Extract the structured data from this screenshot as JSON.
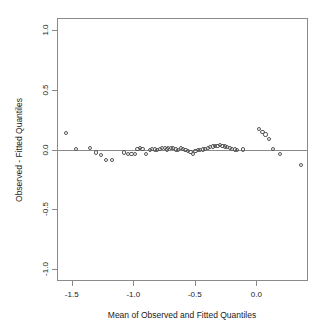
{
  "chart_data": {
    "type": "scatter",
    "title": "",
    "xlabel": "Mean of Observed and Fitted Quantiles",
    "ylabel": "Observed - Fitted Quantiles",
    "xlim": [
      -1.62,
      0.42
    ],
    "ylim": [
      -1.1,
      1.1
    ],
    "xticks": [
      -1.5,
      -1.0,
      -0.5,
      0.0
    ],
    "xtick_labels": [
      "-1.5",
      "-1.0",
      "-0.5",
      "0.0"
    ],
    "yticks": [
      1.0,
      0.5,
      0.0,
      -0.5,
      -1.0
    ],
    "ytick_labels": [
      "1.0",
      "0.5",
      "0.0",
      "-0.5",
      "-1.0"
    ],
    "grid": false,
    "legend": null,
    "marker": "open-circle",
    "marker_color": "#555555",
    "reference_line": {
      "orientation": "horizontal",
      "y": 0.0,
      "color": "#8a8a8a"
    },
    "series": [
      {
        "name": "residual-quantiles",
        "x": [
          -1.545,
          -1.465,
          -1.355,
          -1.305,
          -1.265,
          -1.225,
          -1.175,
          -1.075,
          -1.045,
          -1.015,
          -0.985,
          -0.965,
          -0.945,
          -0.925,
          -0.895,
          -0.865,
          -0.845,
          -0.825,
          -0.805,
          -0.785,
          -0.765,
          -0.745,
          -0.725,
          -0.715,
          -0.695,
          -0.675,
          -0.655,
          -0.635,
          -0.615,
          -0.595,
          -0.575,
          -0.555,
          -0.535,
          -0.515,
          -0.495,
          -0.475,
          -0.455,
          -0.435,
          -0.415,
          -0.395,
          -0.375,
          -0.355,
          -0.335,
          -0.315,
          -0.295,
          -0.275,
          -0.255,
          -0.235,
          -0.215,
          -0.195,
          -0.175,
          -0.155,
          -0.105,
          0.02,
          0.05,
          0.075,
          0.105,
          0.135,
          0.195,
          0.36
        ],
        "y": [
          0.14,
          0.005,
          0.015,
          -0.025,
          -0.045,
          -0.085,
          -0.085,
          -0.025,
          -0.035,
          -0.04,
          -0.04,
          0.005,
          0.01,
          0.005,
          -0.035,
          -0.005,
          0.005,
          0.0,
          -0.005,
          0.005,
          0.01,
          0.015,
          0.0,
          0.015,
          0.015,
          0.01,
          0.0,
          -0.005,
          0.01,
          0.005,
          -0.005,
          -0.01,
          -0.02,
          -0.04,
          -0.01,
          -0.005,
          -0.005,
          0.0,
          0.005,
          0.015,
          0.02,
          0.025,
          0.03,
          0.03,
          0.035,
          0.03,
          0.025,
          0.02,
          0.01,
          0.005,
          0.0,
          -0.005,
          0.0,
          0.17,
          0.145,
          0.125,
          0.085,
          0.005,
          -0.04,
          -0.13
        ]
      }
    ]
  }
}
